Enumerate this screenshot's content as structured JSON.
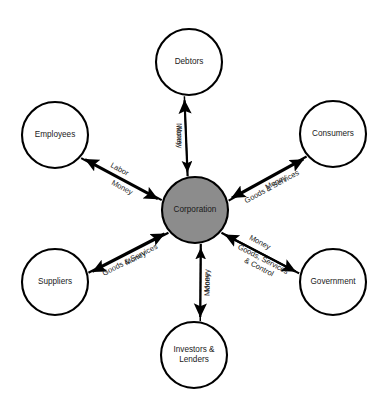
{
  "diagram": {
    "type": "hub-and-spoke",
    "colors": {
      "background": "#ffffff",
      "node_fill": "#ffffff",
      "center_node_fill": "#8c8c8c",
      "stroke": "#000000",
      "text": "#1a1a1a"
    },
    "center": {
      "id": "corporation",
      "label": "Corporation",
      "cx": 195,
      "cy": 210,
      "r": 33
    },
    "nodes": [
      {
        "id": "debtors",
        "label": "Debtors",
        "cx": 189,
        "cy": 62,
        "r": 33,
        "lines": [
          "Debtors"
        ]
      },
      {
        "id": "employees",
        "label": "Employees",
        "cx": 55,
        "cy": 135,
        "r": 33,
        "lines": [
          "Employees"
        ]
      },
      {
        "id": "consumers",
        "label": "Consumers",
        "cx": 333,
        "cy": 134,
        "r": 33,
        "lines": [
          "Consumers"
        ]
      },
      {
        "id": "suppliers",
        "label": "Suppliers",
        "cx": 55,
        "cy": 282,
        "r": 33,
        "lines": [
          "Suppliers"
        ]
      },
      {
        "id": "government",
        "label": "Government",
        "cx": 333,
        "cy": 282,
        "r": 33,
        "lines": [
          "Government"
        ]
      },
      {
        "id": "investors",
        "label": "Investors & Lenders",
        "cx": 194,
        "cy": 355,
        "r": 33,
        "lines": [
          "Investors &",
          "Lenders"
        ]
      }
    ],
    "edges": [
      {
        "id": "corp-to-debtors",
        "from": "corporation",
        "to": "debtors",
        "label": "Money",
        "lines": [
          "Money"
        ]
      },
      {
        "id": "debtors-to-corp",
        "from": "debtors",
        "to": "corporation",
        "label": "Money",
        "lines": [
          "Money"
        ]
      },
      {
        "id": "corp-to-employees",
        "from": "corporation",
        "to": "employees",
        "label": "Money",
        "lines": [
          "Money"
        ]
      },
      {
        "id": "employees-to-corp",
        "from": "employees",
        "to": "corporation",
        "label": "Labor",
        "lines": [
          "Labor"
        ]
      },
      {
        "id": "consumers-to-corp",
        "from": "consumers",
        "to": "corporation",
        "label": "Money",
        "lines": [
          "Money"
        ]
      },
      {
        "id": "corp-to-consumers",
        "from": "corporation",
        "to": "consumers",
        "label": "Goods & Services",
        "lines": [
          "Goods & Services"
        ]
      },
      {
        "id": "corp-to-suppliers",
        "from": "corporation",
        "to": "suppliers",
        "label": "Money",
        "lines": [
          "Money"
        ]
      },
      {
        "id": "suppliers-to-corp",
        "from": "suppliers",
        "to": "corporation",
        "label": "Goods & Services",
        "lines": [
          "Goods & Services"
        ]
      },
      {
        "id": "govt-to-corp",
        "from": "government",
        "to": "corporation",
        "label": "Goods, Services & Control",
        "lines": [
          "Goods, Services",
          "& Control"
        ]
      },
      {
        "id": "corp-to-govt",
        "from": "corporation",
        "to": "government",
        "label": "Money",
        "lines": [
          "Money"
        ]
      },
      {
        "id": "corp-to-investors",
        "from": "corporation",
        "to": "investors",
        "label": "Money",
        "lines": [
          "Money"
        ]
      },
      {
        "id": "investors-to-corp",
        "from": "investors",
        "to": "corporation",
        "label": "Money",
        "lines": [
          "Money"
        ]
      }
    ]
  }
}
